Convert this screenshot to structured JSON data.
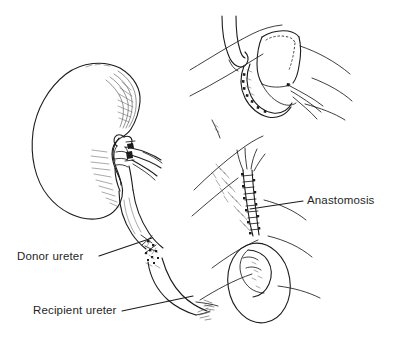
{
  "figure": {
    "background_color": "#ffffff",
    "ink_color": "#1c1c1c",
    "text_color": "#1f1f1f",
    "width": 400,
    "height": 340
  },
  "labels": {
    "donor_ureter": "Donor ureter",
    "recipient_ureter": "Recipient ureter",
    "anastomosis": "Anastomosis"
  },
  "panels": {
    "main": {
      "name": "donor-kidney-with-ureter",
      "contents": "Bean-shaped donor kidney seen from the medial aspect with hilar vessels, renal pelvis and a long ureter descending to a sutured anastomosis with the recipient ureter"
    },
    "inset_top_right": {
      "name": "spatulated-ureter-suture-detail",
      "contents": "Close-up of two spatulated ureteral ends held by suture loops, with the hidden posterior wall shown as a dotted line"
    },
    "inset_bottom_right": {
      "name": "completed-anastomosis-detail",
      "contents": "Close-up of the completed running anastomosis along a ureter with an oval region of surrounding tissue"
    }
  },
  "annotations": [
    {
      "id": "donor-ureter",
      "text": "Donor ureter",
      "leader_from": [
        99,
        256
      ],
      "leader_to": [
        152,
        238
      ]
    },
    {
      "id": "recipient-ureter",
      "text": "Recipient ureter",
      "leader_from": [
        122,
        311
      ],
      "leader_to": [
        193,
        296
      ]
    },
    {
      "id": "anastomosis",
      "text": "Anastomosis",
      "leader_from": [
        303,
        201
      ],
      "leader_to": [
        250,
        209
      ]
    }
  ]
}
